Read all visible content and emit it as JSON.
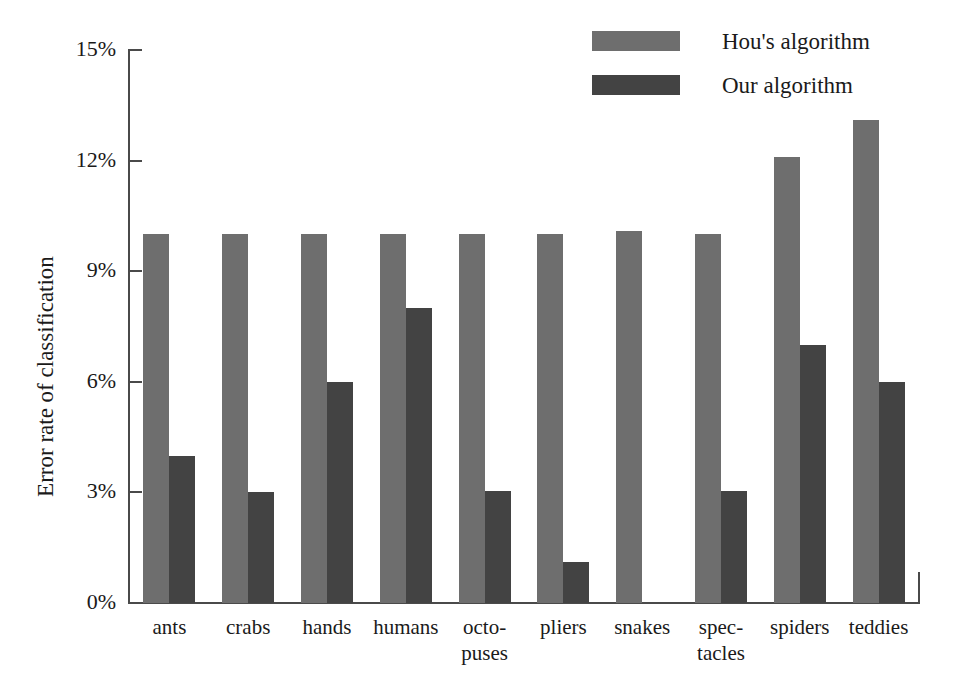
{
  "chart_data": {
    "type": "bar",
    "title": "",
    "xlabel": "",
    "ylabel": "Error rate of classification",
    "ylim": [
      0,
      15
    ],
    "ytick_labels": [
      "15%",
      "12%",
      "9%",
      "6%",
      "3%",
      "0%"
    ],
    "ytick_values": [
      15,
      12,
      9,
      6,
      3,
      0
    ],
    "grid": false,
    "legend_position": "top-right",
    "categories": [
      "ants",
      "crabs",
      "hands",
      "humans",
      "octo-\npuses",
      "pliers",
      "snakes",
      "spec-\ntacles",
      "spiders",
      "teddies"
    ],
    "series": [
      {
        "name": "Hou's algorithm",
        "color": "#6e6e6e",
        "values": [
          10.0,
          10.0,
          10.0,
          10.0,
          10.0,
          10.0,
          10.1,
          10.0,
          12.1,
          13.1
        ]
      },
      {
        "name": "Our algorithm",
        "color": "#434343",
        "values": [
          4.0,
          3.0,
          6.0,
          8.0,
          3.05,
          1.1,
          0,
          3.05,
          7.0,
          6.0
        ]
      }
    ]
  },
  "legend": {
    "items": [
      {
        "label": "Hou's algorithm",
        "color": "#6e6e6e"
      },
      {
        "label": "Our algorithm",
        "color": "#434343"
      }
    ]
  },
  "axes": {
    "y_title": "Error rate of classification"
  }
}
